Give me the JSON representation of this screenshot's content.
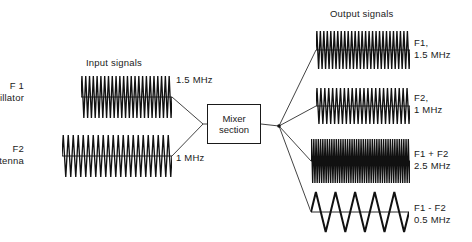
{
  "diagram": {
    "title_input": "Input signals",
    "title_output": "Output signals",
    "stroke_color": "#111111",
    "line_color": "#444444"
  },
  "mixer": {
    "line1": "Mixer",
    "line2": "section",
    "x": 207,
    "y": 104,
    "w": 54,
    "h": 40
  },
  "inputs": [
    {
      "id": "f1-oscillator",
      "name_line1": "F 1",
      "name_line2": "Oscillator",
      "freq_label": "1.5 MHz",
      "freq_mhz": 1.5,
      "cycles": 24,
      "wave_type": "spike",
      "x": 81,
      "y": 73,
      "w": 91,
      "h": 48,
      "amp": 21
    },
    {
      "id": "f2-antenna",
      "name_line1": "F2",
      "name_line2": "Antenna",
      "freq_label": "1 MHz",
      "freq_mhz": 1.0,
      "cycles": 22,
      "wave_type": "spike",
      "x": 62,
      "y": 132,
      "w": 110,
      "h": 48,
      "amp": 21
    }
  ],
  "outputs": [
    {
      "id": "out-f1",
      "label_line1": "F1,",
      "label_line2": "1.5 MHz",
      "freq_mhz": 1.5,
      "cycles": 27,
      "wave_type": "spike",
      "x": 316,
      "y": 28,
      "w": 94,
      "h": 44,
      "amp": 19
    },
    {
      "id": "out-f2",
      "label_line1": "F2,",
      "label_line2": "1 MHz",
      "freq_mhz": 1.0,
      "cycles": 24,
      "wave_type": "spike",
      "x": 316,
      "y": 85,
      "w": 94,
      "h": 42,
      "amp": 18
    },
    {
      "id": "out-sum",
      "label_line1": "F1 + F2",
      "label_line2": "2.5 MHz",
      "freq_mhz": 2.5,
      "cycles": 44,
      "wave_type": "spike",
      "x": 311,
      "y": 137,
      "w": 99,
      "h": 48,
      "amp": 22
    },
    {
      "id": "out-diff",
      "label_line1": "F1 - F2",
      "label_line2": "0.5 MHz",
      "freq_mhz": 0.5,
      "cycles": 5,
      "wave_type": "triangle",
      "x": 311,
      "y": 190,
      "w": 98,
      "h": 44,
      "amp": 20
    }
  ],
  "labels": {
    "input_title": {
      "x": 86,
      "y": 57
    },
    "output_title": {
      "x": 330,
      "y": 8
    },
    "f1_name": {
      "x": 24,
      "y": 80
    },
    "f2_name": {
      "x": 24,
      "y": 143
    },
    "f1_freq": {
      "x": 176,
      "y": 74
    },
    "f2_freq": {
      "x": 176,
      "y": 152
    },
    "out_f1": {
      "x": 414,
      "y": 37
    },
    "out_f2": {
      "x": 414,
      "y": 92
    },
    "out_sum": {
      "x": 414,
      "y": 148
    },
    "out_diff": {
      "x": 414,
      "y": 202
    }
  },
  "connectors": {
    "junction_in": {
      "x": 203,
      "y": 124
    },
    "junction_out": {
      "x": 279,
      "y": 126
    },
    "input_taps": [
      {
        "x": 172,
        "y": 97
      },
      {
        "x": 172,
        "y": 156
      }
    ],
    "output_taps": [
      {
        "x": 316,
        "y": 50
      },
      {
        "x": 316,
        "y": 106
      },
      {
        "x": 311,
        "y": 161
      },
      {
        "x": 311,
        "y": 212
      }
    ]
  }
}
